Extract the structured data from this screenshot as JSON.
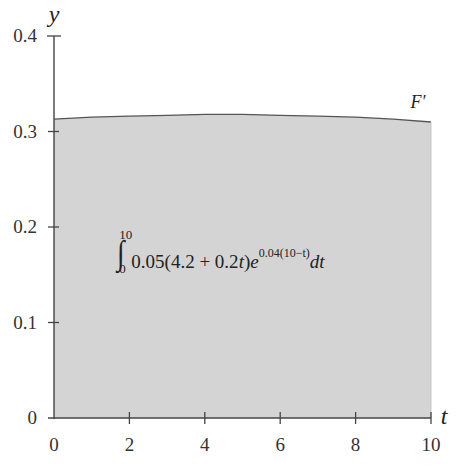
{
  "chart_data": {
    "type": "area",
    "title": "",
    "xlabel": "t",
    "ylabel": "y",
    "xlim": [
      0,
      10
    ],
    "ylim": [
      0,
      0.4
    ],
    "x_ticks": [
      "0",
      "2",
      "4",
      "6",
      "8",
      "10"
    ],
    "y_ticks": [
      "0",
      "0.1",
      "0.2",
      "0.3",
      "0.4"
    ],
    "grid": false,
    "series": [
      {
        "name": "F'",
        "label": "F′",
        "x": [
          0,
          1,
          2,
          3,
          4,
          5,
          6,
          7,
          8,
          9,
          10
        ],
        "values": [
          0.313,
          0.315,
          0.316,
          0.317,
          0.318,
          0.318,
          0.317,
          0.316,
          0.315,
          0.313,
          0.31
        ],
        "fill": "#d4d4d4",
        "line_color": "#555555"
      }
    ],
    "annotations": [
      {
        "text": "∫₀¹⁰ 0.05(4.2 + 0.2t)e^{0.04(10−t)} dt",
        "position": "center of shaded region"
      }
    ]
  },
  "labels": {
    "y_axis": "y",
    "x_axis": "t",
    "curve": "F′",
    "y_ticks": [
      "0",
      "0.1",
      "0.2",
      "0.3",
      "0.4"
    ],
    "x_ticks": [
      "0",
      "2",
      "4",
      "6",
      "8",
      "10"
    ]
  },
  "formula": {
    "integral_sign": "∫",
    "upper_limit": "10",
    "lower_limit": "0",
    "integrand": "0.05(4.2 + 0.2",
    "var1": "t",
    "close": ")",
    "base": "e",
    "exponent": "0.04(10−t)",
    "differential": "dt"
  }
}
